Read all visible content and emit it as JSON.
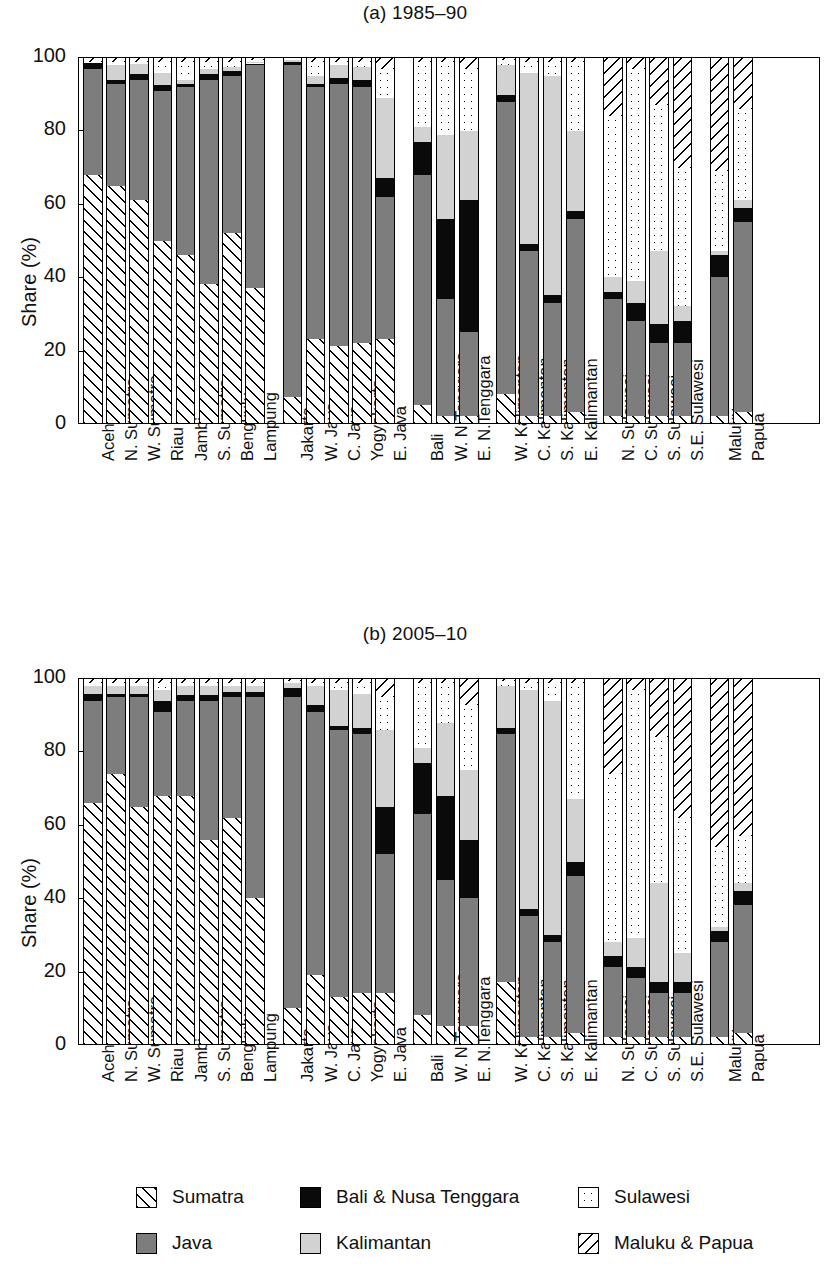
{
  "figure": {
    "ylabel": "Share (%)",
    "yticks": [
      "0",
      "20",
      "40",
      "60",
      "80",
      "100"
    ],
    "ylim": [
      0,
      100
    ]
  },
  "legend": {
    "items": [
      {
        "key": "sumatra",
        "label": "Sumatra",
        "icon": "hatch-forward-swatch",
        "color": "#ffffff"
      },
      {
        "key": "bali",
        "label": "Bali & Nusa Tenggara",
        "icon": "solid-black-swatch",
        "color": "#0a0a0a"
      },
      {
        "key": "sulawesi",
        "label": "Sulawesi",
        "icon": "dotted-swatch",
        "color": "#ffffff"
      },
      {
        "key": "java",
        "label": "Java",
        "icon": "dark-gray-swatch",
        "color": "#7d7d7d"
      },
      {
        "key": "kalimantan",
        "label": "Kalimantan",
        "icon": "light-gray-swatch",
        "color": "#d2d2d2"
      },
      {
        "key": "maluku",
        "label": "Maluku & Papua",
        "icon": "hatch-back-swatch",
        "color": "#ffffff"
      }
    ]
  },
  "chart_data": [
    {
      "type": "bar",
      "stacked": true,
      "title": "(a) 1985–90",
      "xlabel": "",
      "ylabel": "Share (%)",
      "ylim": [
        0,
        100
      ],
      "yticks": [
        0,
        20,
        40,
        60,
        80,
        100
      ],
      "grid": false,
      "legend_position": "bottom",
      "series_order": [
        "sumatra",
        "java",
        "bali",
        "kalimantan",
        "sulawesi",
        "maluku"
      ],
      "groups": [
        {
          "name": "Sumatra",
          "categories": [
            "Aceh",
            "N. Sumatra",
            "W. Sumatra",
            "Riau",
            "Jambi",
            "S. Sumatra",
            "Bengkulu",
            "Lampung"
          ]
        },
        {
          "name": "Java",
          "categories": [
            "Jakarta",
            "W. Java",
            "C. Java",
            "Yogyakarta",
            "E. Java"
          ]
        },
        {
          "name": "Bali & Nusa Tenggara",
          "categories": [
            "Bali",
            "W. N.Tenggara",
            "E. N.Tenggara"
          ]
        },
        {
          "name": "Kalimantan",
          "categories": [
            "W. Kalimantan",
            "C. Kalimantan",
            "S. Kalimantan",
            "E. Kalimantan"
          ]
        },
        {
          "name": "Sulawesi",
          "categories": [
            "N. Sulawesi",
            "C. Sulawesi",
            "S. Sulawesi",
            "S.E. Sulawesi"
          ]
        },
        {
          "name": "Maluku & Papua",
          "categories": [
            "Maluku",
            "Papua"
          ]
        }
      ],
      "bars": [
        {
          "category": "Aceh",
          "sumatra": 68,
          "java": 29,
          "bali": 1.5,
          "kalimantan": 0,
          "sulawesi": 0.5,
          "maluku": 1
        },
        {
          "category": "N. Sumatra",
          "sumatra": 65,
          "java": 28,
          "bali": 1,
          "kalimantan": 4,
          "sulawesi": 1,
          "maluku": 1
        },
        {
          "category": "W. Sumatra",
          "sumatra": 61,
          "java": 33,
          "bali": 1.5,
          "kalimantan": 3,
          "sulawesi": 0.5,
          "maluku": 1
        },
        {
          "category": "Riau",
          "sumatra": 50,
          "java": 41,
          "bali": 1.5,
          "kalimantan": 3.5,
          "sulawesi": 3,
          "maluku": 1
        },
        {
          "category": "Jambi",
          "sumatra": 46,
          "java": 46,
          "bali": 1,
          "kalimantan": 1,
          "sulawesi": 5,
          "maluku": 1
        },
        {
          "category": "S. Sumatra",
          "sumatra": 38,
          "java": 56,
          "bali": 1.5,
          "kalimantan": 1.5,
          "sulawesi": 2,
          "maluku": 1
        },
        {
          "category": "Bengkulu",
          "sumatra": 52,
          "java": 43,
          "bali": 1.5,
          "kalimantan": 1,
          "sulawesi": 1.5,
          "maluku": 1
        },
        {
          "category": "Lampung",
          "sumatra": 37,
          "java": 61,
          "bali": 0.5,
          "kalimantan": 0.5,
          "sulawesi": 0.5,
          "maluku": 0.5
        },
        {
          "category": "Jakarta",
          "sumatra": 7,
          "java": 91,
          "bali": 1,
          "kalimantan": 0.5,
          "sulawesi": 0.5,
          "maluku": 0
        },
        {
          "category": "W. Java",
          "sumatra": 23,
          "java": 69,
          "bali": 1,
          "kalimantan": 2,
          "sulawesi": 4,
          "maluku": 1
        },
        {
          "category": "C. Java",
          "sumatra": 21,
          "java": 72,
          "bali": 1.5,
          "kalimantan": 3.5,
          "sulawesi": 1,
          "maluku": 1
        },
        {
          "category": "Yogyakarta",
          "sumatra": 22,
          "java": 70,
          "bali": 2,
          "kalimantan": 3.5,
          "sulawesi": 1.5,
          "maluku": 1
        },
        {
          "category": "E. Java",
          "sumatra": 23,
          "java": 39,
          "bali": 5,
          "kalimantan": 22,
          "sulawesi": 8,
          "maluku": 3
        },
        {
          "category": "Bali",
          "sumatra": 5,
          "java": 63,
          "bali": 9,
          "kalimantan": 4,
          "sulawesi": 18,
          "maluku": 1
        },
        {
          "category": "W. N.Tenggara",
          "sumatra": 2,
          "java": 32,
          "bali": 22,
          "kalimantan": 23,
          "sulawesi": 20,
          "maluku": 1
        },
        {
          "category": "E. N.Tenggara",
          "sumatra": 2,
          "java": 23,
          "bali": 36,
          "kalimantan": 19,
          "sulawesi": 17,
          "maluku": 3
        },
        {
          "category": "W. Kalimantan",
          "sumatra": 8,
          "java": 80,
          "bali": 2,
          "kalimantan": 8,
          "sulawesi": 1.5,
          "maluku": 0.5
        },
        {
          "category": "C. Kalimantan",
          "sumatra": 2,
          "java": 45,
          "bali": 2,
          "kalimantan": 47,
          "sulawesi": 3,
          "maluku": 1
        },
        {
          "category": "S. Kalimantan",
          "sumatra": 2,
          "java": 31,
          "bali": 2,
          "kalimantan": 60,
          "sulawesi": 4,
          "maluku": 1
        },
        {
          "category": "E. Kalimantan",
          "sumatra": 3,
          "java": 53,
          "bali": 2,
          "kalimantan": 22,
          "sulawesi": 19,
          "maluku": 1
        },
        {
          "category": "N. Sulawesi",
          "sumatra": 2,
          "java": 32,
          "bali": 2,
          "kalimantan": 4,
          "sulawesi": 44,
          "maluku": 16
        },
        {
          "category": "C. Sulawesi",
          "sumatra": 2,
          "java": 26,
          "bali": 5,
          "kalimantan": 6,
          "sulawesi": 58,
          "maluku": 3
        },
        {
          "category": "S. Sulawesi",
          "sumatra": 2,
          "java": 20,
          "bali": 5,
          "kalimantan": 20,
          "sulawesi": 40,
          "maluku": 13
        },
        {
          "category": "S.E. Sulawesi",
          "sumatra": 2,
          "java": 20,
          "bali": 6,
          "kalimantan": 4,
          "sulawesi": 38,
          "maluku": 30
        },
        {
          "category": "Maluku",
          "sumatra": 2,
          "java": 38,
          "bali": 6,
          "kalimantan": 1,
          "sulawesi": 22,
          "maluku": 31
        },
        {
          "category": "Papua",
          "sumatra": 3,
          "java": 52,
          "bali": 4,
          "kalimantan": 2,
          "sulawesi": 25,
          "maluku": 14
        }
      ]
    },
    {
      "type": "bar",
      "stacked": true,
      "title": "(b) 2005–10",
      "xlabel": "",
      "ylabel": "Share (%)",
      "ylim": [
        0,
        100
      ],
      "yticks": [
        0,
        20,
        40,
        60,
        80,
        100
      ],
      "grid": false,
      "legend_position": "bottom",
      "series_order": [
        "sumatra",
        "java",
        "bali",
        "kalimantan",
        "sulawesi",
        "maluku"
      ],
      "groups": [
        {
          "name": "Sumatra",
          "categories": [
            "Aceh",
            "N. Sumatra",
            "W. Sumatra",
            "Riau",
            "Jambi",
            "S. Sumatra",
            "Bengkulu",
            "Lampung"
          ]
        },
        {
          "name": "Java",
          "categories": [
            "Jakarta",
            "W. Java",
            "C. Java",
            "Yogyakarta",
            "E. Java"
          ]
        },
        {
          "name": "Bali & Nusa Tenggara",
          "categories": [
            "Bali",
            "W. N.Tenggara",
            "E. N.Tenggara"
          ]
        },
        {
          "name": "Kalimantan",
          "categories": [
            "W. Kalimantan",
            "C. Kalimantan",
            "S. Kalimantan",
            "E. Kalimantan"
          ]
        },
        {
          "name": "Sulawesi",
          "categories": [
            "N. Sulawesi",
            "C. Sulawesi",
            "S. Sulawesi",
            "S.E. Sulawesi"
          ]
        },
        {
          "name": "Maluku & Papua",
          "categories": [
            "Maluku",
            "Papua"
          ]
        }
      ],
      "bars": [
        {
          "category": "Aceh",
          "sumatra": 66,
          "java": 28,
          "bali": 2,
          "kalimantan": 2,
          "sulawesi": 1,
          "maluku": 1
        },
        {
          "category": "N. Sumatra",
          "sumatra": 74,
          "java": 21,
          "bali": 1,
          "kalimantan": 2,
          "sulawesi": 1,
          "maluku": 1
        },
        {
          "category": "W. Sumatra",
          "sumatra": 65,
          "java": 30,
          "bali": 1,
          "kalimantan": 2,
          "sulawesi": 1,
          "maluku": 1
        },
        {
          "category": "Riau",
          "sumatra": 68,
          "java": 23,
          "bali": 3,
          "kalimantan": 3,
          "sulawesi": 2,
          "maluku": 1
        },
        {
          "category": "Jambi",
          "sumatra": 68,
          "java": 26,
          "bali": 1.5,
          "kalimantan": 2.5,
          "sulawesi": 1,
          "maluku": 1
        },
        {
          "category": "S. Sumatra",
          "sumatra": 56,
          "java": 38,
          "bali": 1.5,
          "kalimantan": 2.5,
          "sulawesi": 1,
          "maluku": 1
        },
        {
          "category": "Bengkulu",
          "sumatra": 62,
          "java": 33,
          "bali": 1.5,
          "kalimantan": 1.5,
          "sulawesi": 1,
          "maluku": 1
        },
        {
          "category": "Lampung",
          "sumatra": 40,
          "java": 55,
          "bali": 1.5,
          "kalimantan": 1.5,
          "sulawesi": 1,
          "maluku": 1
        },
        {
          "category": "Jakarta",
          "sumatra": 10,
          "java": 85,
          "bali": 2.5,
          "kalimantan": 1.5,
          "sulawesi": 0.5,
          "maluku": 0.5
        },
        {
          "category": "W. Java",
          "sumatra": 19,
          "java": 72,
          "bali": 2,
          "kalimantan": 5,
          "sulawesi": 1,
          "maluku": 1
        },
        {
          "category": "C. Java",
          "sumatra": 13,
          "java": 73,
          "bali": 1,
          "kalimantan": 10,
          "sulawesi": 2,
          "maluku": 1
        },
        {
          "category": "Yogyakarta",
          "sumatra": 14,
          "java": 71,
          "bali": 1.5,
          "kalimantan": 9.5,
          "sulawesi": 3,
          "maluku": 1
        },
        {
          "category": "E. Java",
          "sumatra": 14,
          "java": 38,
          "bali": 13,
          "kalimantan": 21,
          "sulawesi": 9,
          "maluku": 5
        },
        {
          "category": "Bali",
          "sumatra": 8,
          "java": 55,
          "bali": 14,
          "kalimantan": 4,
          "sulawesi": 18,
          "maluku": 1
        },
        {
          "category": "W. N.Tenggara",
          "sumatra": 5,
          "java": 40,
          "bali": 23,
          "kalimantan": 20,
          "sulawesi": 11,
          "maluku": 1
        },
        {
          "category": "E. N.Tenggara",
          "sumatra": 5,
          "java": 35,
          "bali": 16,
          "kalimantan": 19,
          "sulawesi": 18,
          "maluku": 7
        },
        {
          "category": "W. Kalimantan",
          "sumatra": 17,
          "java": 68,
          "bali": 1.5,
          "kalimantan": 11.5,
          "sulawesi": 1.5,
          "maluku": 0.5
        },
        {
          "category": "C. Kalimantan",
          "sumatra": 2,
          "java": 33,
          "bali": 2,
          "kalimantan": 60,
          "sulawesi": 2,
          "maluku": 1
        },
        {
          "category": "S. Kalimantan",
          "sumatra": 2,
          "java": 26,
          "bali": 2,
          "kalimantan": 64,
          "sulawesi": 5,
          "maluku": 1
        },
        {
          "category": "E. Kalimantan",
          "sumatra": 3,
          "java": 43,
          "bali": 4,
          "kalimantan": 17,
          "sulawesi": 32,
          "maluku": 1
        },
        {
          "category": "N. Sulawesi",
          "sumatra": 2,
          "java": 19,
          "bali": 3,
          "kalimantan": 4,
          "sulawesi": 46,
          "maluku": 26
        },
        {
          "category": "C. Sulawesi",
          "sumatra": 2,
          "java": 16,
          "bali": 3,
          "kalimantan": 8,
          "sulawesi": 68,
          "maluku": 3
        },
        {
          "category": "S. Sulawesi",
          "sumatra": 2,
          "java": 12,
          "bali": 3,
          "kalimantan": 27,
          "sulawesi": 40,
          "maluku": 16
        },
        {
          "category": "S.E. Sulawesi",
          "sumatra": 2,
          "java": 12,
          "bali": 3,
          "kalimantan": 8,
          "sulawesi": 37,
          "maluku": 38
        },
        {
          "category": "Maluku",
          "sumatra": 2,
          "java": 26,
          "bali": 3,
          "kalimantan": 1,
          "sulawesi": 22,
          "maluku": 46
        },
        {
          "category": "Papua",
          "sumatra": 3,
          "java": 35,
          "bali": 4,
          "kalimantan": 2,
          "sulawesi": 13,
          "maluku": 43
        }
      ]
    }
  ]
}
